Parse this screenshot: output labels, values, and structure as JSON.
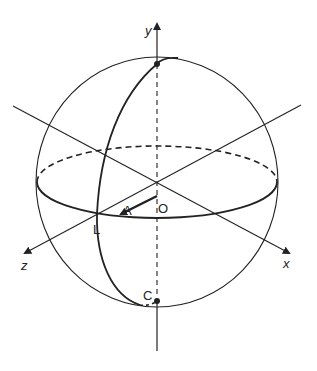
{
  "diagram": {
    "type": "celestial-sphere",
    "colors": {
      "stroke": "#222222",
      "background": "#ffffff"
    },
    "axes": {
      "x": {
        "label": "x"
      },
      "y": {
        "label": "y"
      },
      "z": {
        "label": "z"
      }
    },
    "points": {
      "origin": {
        "label": "O"
      },
      "vector_tip": {
        "label": "A"
      },
      "meridian_equator": {
        "label": "L"
      },
      "bottom": {
        "label": "C"
      }
    }
  }
}
